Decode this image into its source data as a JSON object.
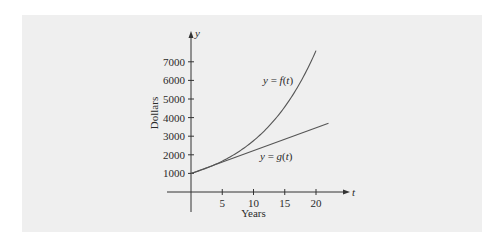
{
  "chart_data": {
    "type": "line",
    "title": "",
    "xlabel": "Years",
    "ylabel": "Dollars",
    "x_axis_symbol": "t",
    "y_axis_symbol": "y",
    "xticks": [
      5,
      10,
      15,
      20
    ],
    "yticks": [
      1000,
      2000,
      3000,
      4000,
      5000,
      6000,
      7000
    ],
    "xlim": [
      0,
      25
    ],
    "ylim": [
      0,
      7000
    ],
    "grid": false,
    "legend": "inline labels",
    "series": [
      {
        "name": "y = f(t)",
        "label_parts": {
          "pre": "y = ",
          "fn": "f",
          "arg": "(t)"
        },
        "kind": "exponential",
        "x": [
          0,
          2,
          4,
          6,
          8,
          10,
          12,
          14,
          16,
          18,
          20
        ],
        "values": [
          1000,
          1220,
          1500,
          1840,
          2250,
          2760,
          3380,
          4140,
          5070,
          6210,
          7600
        ]
      },
      {
        "name": "y = g(t)",
        "label_parts": {
          "pre": "y = ",
          "fn": "g",
          "arg": "(t)"
        },
        "kind": "linear",
        "x": [
          0,
          22
        ],
        "values": [
          1000,
          3700
        ]
      }
    ],
    "colors": {
      "panel": "#efefef",
      "line": "#555555",
      "axis": "#333333"
    }
  }
}
